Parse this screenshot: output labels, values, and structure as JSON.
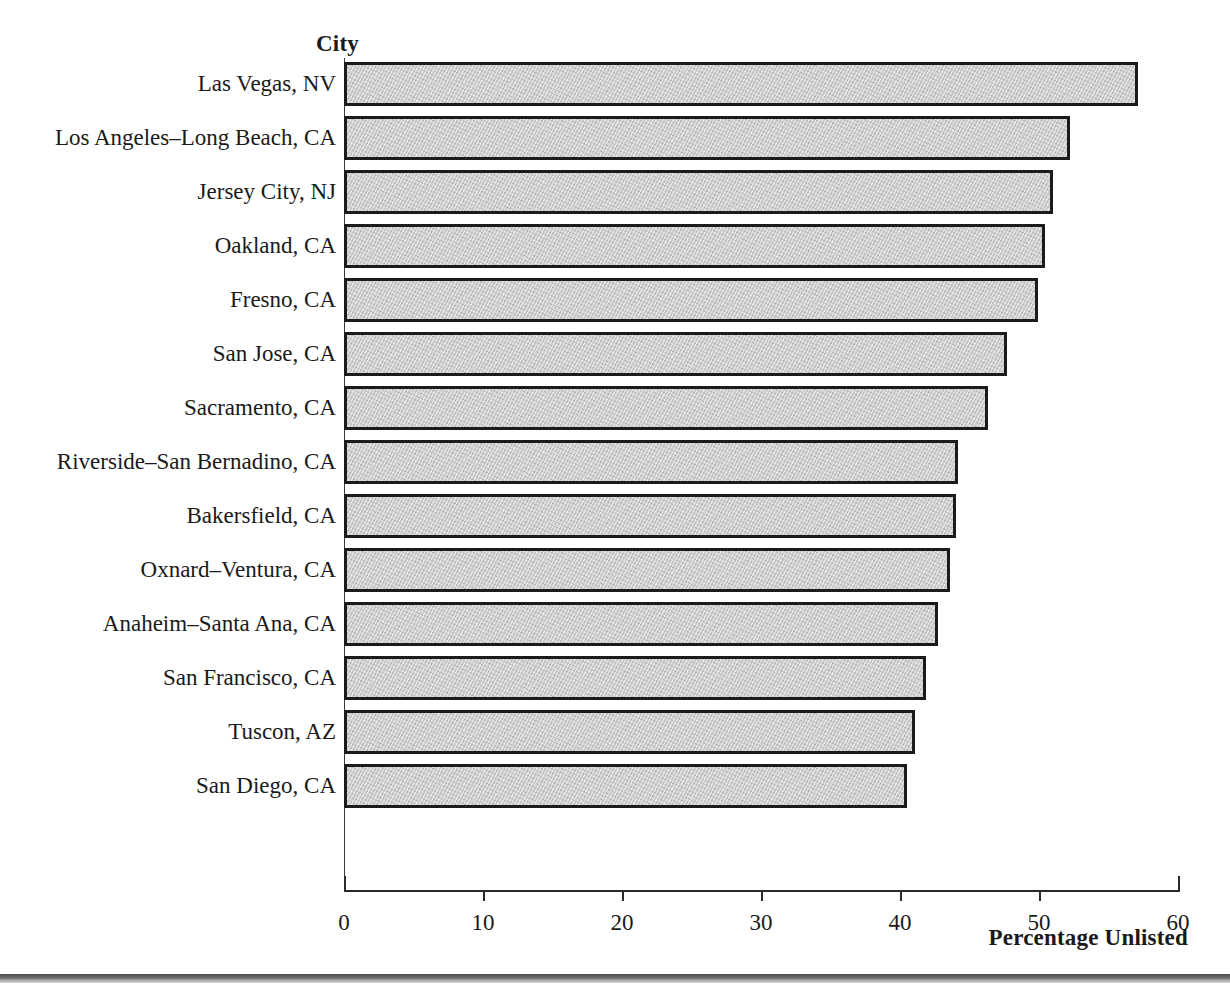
{
  "chart_data": {
    "type": "bar",
    "orientation": "horizontal",
    "title": "",
    "xlabel": "Percentage Unlisted",
    "ylabel": "City",
    "xlim": [
      0,
      60
    ],
    "xticks": [
      0,
      10,
      20,
      30,
      40,
      50,
      60
    ],
    "xtick_labels": [
      "0",
      "10",
      "20",
      "30",
      "40",
      "50",
      "60"
    ],
    "grid": false,
    "legend": null,
    "bar_fill_color": "#cdcdcd",
    "bar_border_color": "#1b1b1b",
    "background_color": "#ffffff",
    "categories": [
      "Las Vegas, NV",
      "Los Angeles–Long Beach, CA",
      "Jersey City, NJ",
      "Oakland, CA",
      "Fresno, CA",
      "San Jose, CA",
      "Sacramento, CA",
      "Riverside–San Bernadino, CA",
      "Bakersfield, CA",
      "Oxnard–Ventura, CA",
      "Anaheim–Santa Ana, CA",
      "San Francisco, CA",
      "Tuscon, AZ",
      "San Diego, CA"
    ],
    "values": [
      57.1,
      52.2,
      51.0,
      50.4,
      49.9,
      47.7,
      46.3,
      44.2,
      44.0,
      43.6,
      42.7,
      41.9,
      41.1,
      40.5
    ]
  }
}
